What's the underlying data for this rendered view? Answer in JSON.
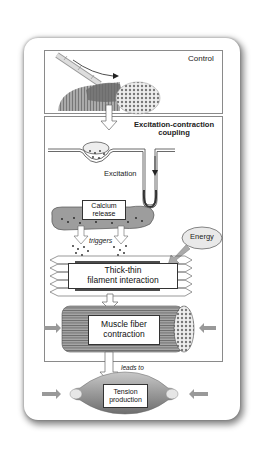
{
  "diagram": {
    "panels": {
      "control": {
        "label": "Control"
      },
      "ec_coupling": {
        "title_line1": "Excitation-contraction",
        "title_line2": "coupling"
      }
    },
    "labels": {
      "excitation": "Excitation",
      "calcium_release_line1": "Calcium",
      "calcium_release_line2": "release",
      "triggers": "triggers",
      "energy": "Energy",
      "thick_thin_line1": "Thick-thin",
      "thick_thin_line2": "filament interaction",
      "muscle_fiber_line1": "Muscle fiber",
      "muscle_fiber_line2": "contraction",
      "leads_to": "leads to",
      "tension_line1": "Tension",
      "tension_line2": "production"
    },
    "colors": {
      "muscle": "#8c8c8c",
      "arrow": "#9a9a9a",
      "outline": "#333333"
    }
  }
}
